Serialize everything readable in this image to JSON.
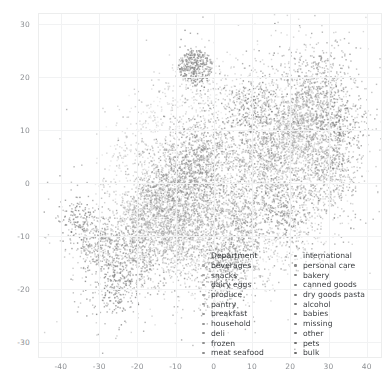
{
  "figure": {
    "background": "#ffffff",
    "point_color": "#9a9a9a",
    "grid_color": "#f1f2f3",
    "frame_color": "#eceded",
    "tick_color": "#8d9094"
  },
  "chart_data": {
    "type": "scatter",
    "title": "",
    "xlabel": "",
    "ylabel": "",
    "xlim": [
      -46,
      44
    ],
    "ylim": [
      -33,
      32
    ],
    "grid": true,
    "legend_position": "lower-center-right",
    "legend_title": "Department",
    "xticks": [
      -40,
      -30,
      -20,
      -10,
      0,
      10,
      20,
      30,
      40
    ],
    "yticks": [
      30,
      20,
      10,
      0,
      -10,
      -20,
      -30
    ],
    "xticklabels": [
      "-40",
      "-30",
      "-20",
      "-10",
      "0",
      "10",
      "20",
      "30",
      "40"
    ],
    "yticklabels": [
      "30",
      "20",
      "10",
      "0",
      "-10",
      "-20",
      "-30"
    ],
    "marker_size": 1.4,
    "point_count": 9000,
    "series": [
      {
        "name": "beverages",
        "color": "#a8a8a8",
        "cluster": [
          -18,
          -7
        ],
        "spread": [
          7,
          6
        ],
        "n": 520
      },
      {
        "name": "snacks",
        "color": "#a5a5a5",
        "cluster": [
          -10,
          -10
        ],
        "spread": [
          8,
          6
        ],
        "n": 620
      },
      {
        "name": "dairy eggs",
        "color": "#a2a2a2",
        "cluster": [
          20,
          8
        ],
        "spread": [
          9,
          8
        ],
        "n": 700
      },
      {
        "name": "produce",
        "color": "#9f9f9f",
        "cluster": [
          24,
          13
        ],
        "spread": [
          8,
          7
        ],
        "n": 640
      },
      {
        "name": "pantry",
        "color": "#9c9c9c",
        "cluster": [
          -5,
          -3
        ],
        "spread": [
          9,
          8
        ],
        "n": 700
      },
      {
        "name": "breakfast",
        "color": "#999999",
        "cluster": [
          -14,
          -2
        ],
        "spread": [
          6,
          5
        ],
        "n": 380
      },
      {
        "name": "household",
        "color": "#969696",
        "cluster": [
          30,
          2
        ],
        "spread": [
          6,
          7
        ],
        "n": 420
      },
      {
        "name": "deli",
        "color": "#939393",
        "cluster": [
          12,
          4
        ],
        "spread": [
          7,
          7
        ],
        "n": 430
      },
      {
        "name": "frozen",
        "color": "#909090",
        "cluster": [
          -22,
          -14
        ],
        "spread": [
          7,
          6
        ],
        "n": 480
      },
      {
        "name": "meat seafood",
        "color": "#8d8d8d",
        "cluster": [
          6,
          -8
        ],
        "spread": [
          7,
          6
        ],
        "n": 420
      },
      {
        "name": "international",
        "color": "#8a8a8a",
        "cluster": [
          -30,
          -11
        ],
        "spread": [
          5,
          5
        ],
        "n": 300
      },
      {
        "name": "personal care",
        "color": "#878787",
        "cluster": [
          28,
          19
        ],
        "spread": [
          7,
          6
        ],
        "n": 400
      },
      {
        "name": "bakery",
        "color": "#848484",
        "cluster": [
          -2,
          6
        ],
        "spread": [
          6,
          6
        ],
        "n": 360
      },
      {
        "name": "canned goods",
        "color": "#818181",
        "cluster": [
          -8,
          2
        ],
        "spread": [
          7,
          6
        ],
        "n": 380
      },
      {
        "name": "dry goods pasta",
        "color": "#7e7e7e",
        "cluster": [
          2,
          -16
        ],
        "spread": [
          7,
          6
        ],
        "n": 380
      },
      {
        "name": "alcohol",
        "color": "#7b7b7b",
        "cluster": [
          18,
          -5
        ],
        "spread": [
          6,
          6
        ],
        "n": 330
      },
      {
        "name": "babies",
        "color": "#787878",
        "cluster": [
          33,
          10
        ],
        "spread": [
          5,
          6
        ],
        "n": 300
      },
      {
        "name": "missing",
        "color": "#757575",
        "cluster": [
          -5,
          22
        ],
        "spread": [
          3,
          3
        ],
        "n": 180
      },
      {
        "name": "other",
        "color": "#727272",
        "cluster": [
          -36,
          -7
        ],
        "spread": [
          4,
          4
        ],
        "n": 150
      },
      {
        "name": "pets",
        "color": "#6f6f6f",
        "cluster": [
          10,
          14
        ],
        "spread": [
          6,
          6
        ],
        "n": 280
      },
      {
        "name": "bulk",
        "color": "#6c6c6c",
        "cluster": [
          -26,
          -20
        ],
        "spread": [
          5,
          5
        ],
        "n": 200
      }
    ]
  },
  "legend": {
    "title": "Department",
    "left_column": [
      {
        "label": "Department",
        "is_title": true,
        "color": "none"
      },
      {
        "label": "beverages",
        "is_title": false,
        "color": "#a8a8a8"
      },
      {
        "label": "snacks",
        "is_title": false,
        "color": "#a5a5a5"
      },
      {
        "label": "dairy eggs",
        "is_title": false,
        "color": "#a2a2a2"
      },
      {
        "label": "produce",
        "is_title": false,
        "color": "#9f9f9f"
      },
      {
        "label": "pantry",
        "is_title": false,
        "color": "#9c9c9c"
      },
      {
        "label": "breakfast",
        "is_title": false,
        "color": "#999999"
      },
      {
        "label": "household",
        "is_title": false,
        "color": "#969696"
      },
      {
        "label": "deli",
        "is_title": false,
        "color": "#939393"
      },
      {
        "label": "frozen",
        "is_title": false,
        "color": "#909090"
      },
      {
        "label": "meat seafood",
        "is_title": false,
        "color": "#8d8d8d"
      }
    ],
    "right_column": [
      {
        "label": "international",
        "is_title": false,
        "color": "#8a8a8a"
      },
      {
        "label": "personal care",
        "is_title": false,
        "color": "#878787"
      },
      {
        "label": "bakery",
        "is_title": false,
        "color": "#848484"
      },
      {
        "label": "canned goods",
        "is_title": false,
        "color": "#818181"
      },
      {
        "label": "dry goods pasta",
        "is_title": false,
        "color": "#7e7e7e"
      },
      {
        "label": "alcohol",
        "is_title": false,
        "color": "#7b7b7b"
      },
      {
        "label": "babies",
        "is_title": false,
        "color": "#787878"
      },
      {
        "label": "missing",
        "is_title": false,
        "color": "#757575"
      },
      {
        "label": "other",
        "is_title": false,
        "color": "#727272"
      },
      {
        "label": "pets",
        "is_title": false,
        "color": "#6f6f6f"
      },
      {
        "label": "bulk",
        "is_title": false,
        "color": "#6c6c6c"
      }
    ]
  }
}
